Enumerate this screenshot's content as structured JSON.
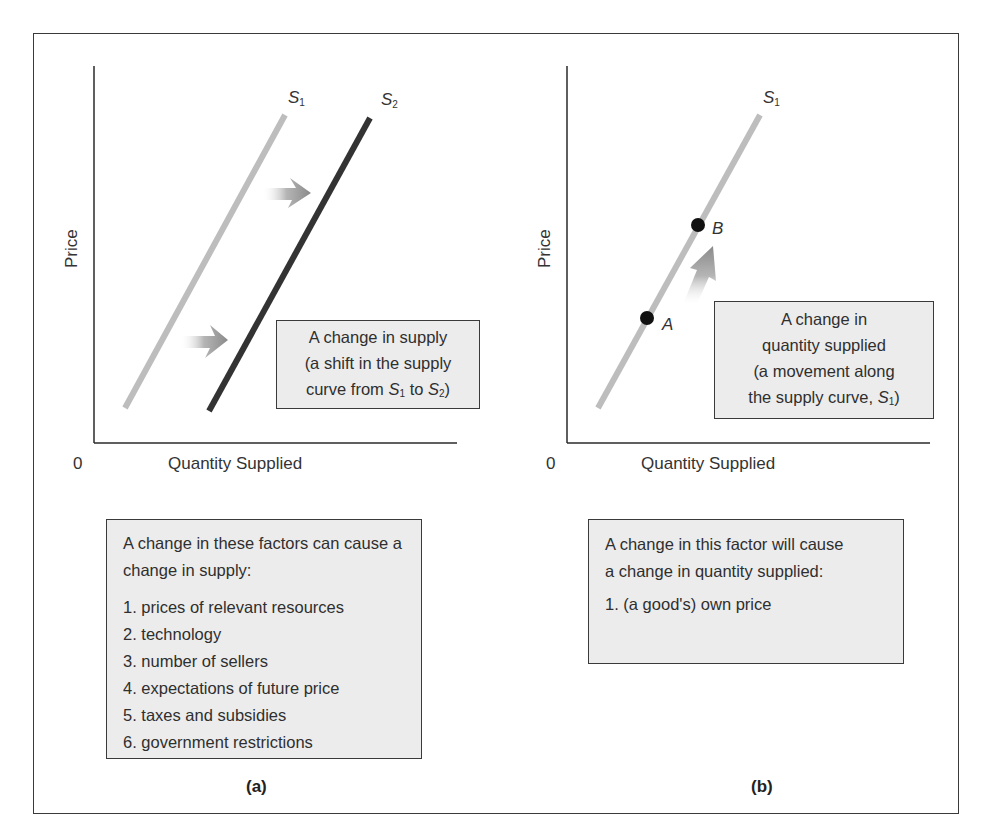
{
  "figure": {
    "panels": [
      {
        "tag": "(a)",
        "axes": {
          "y_label": "Price",
          "x_label": "Quantity Supplied",
          "origin": "0"
        },
        "curves": [
          {
            "name": "S",
            "subscript": "1",
            "color": "#bdbdbd"
          },
          {
            "name": "S",
            "subscript": "2",
            "color": "#333333"
          }
        ],
        "arrows": [
          {
            "direction": "right",
            "meaning": "shift-right"
          },
          {
            "direction": "right",
            "meaning": "shift-right"
          }
        ],
        "callout": {
          "line1": "A change in supply",
          "line2": "(a shift in the supply",
          "line3_prefix": "curve from ",
          "line3_s1": "S",
          "line3_s1_sub": "1",
          "line3_mid": " to ",
          "line3_s2": "S",
          "line3_s2_sub": "2",
          "line3_suffix": ")"
        },
        "factors_box": {
          "intro": "A change in these factors can cause a change in supply:",
          "items": [
            "1. prices of relevant resources",
            "2. technology",
            "3. number of sellers",
            "4. expectations of future price",
            "5. taxes and subsidies",
            "6. government restrictions"
          ]
        }
      },
      {
        "tag": "(b)",
        "axes": {
          "y_label": "Price",
          "x_label": "Quantity Supplied",
          "origin": "0"
        },
        "curves": [
          {
            "name": "S",
            "subscript": "1",
            "color": "#bdbdbd"
          }
        ],
        "points": [
          {
            "label": "A"
          },
          {
            "label": "B"
          }
        ],
        "arrows": [
          {
            "direction": "up-along-curve",
            "meaning": "movement-from-A-to-B"
          }
        ],
        "callout": {
          "line1": "A change in",
          "line2": "quantity supplied",
          "line3": "(a movement along",
          "line4_prefix": "the supply curve, ",
          "line4_s": "S",
          "line4_s_sub": "1",
          "line4_suffix": ")"
        },
        "factors_box": {
          "intro": "A change in this factor will cause a change in quantity supplied:",
          "items": [
            "1. (a good's) own price"
          ]
        }
      }
    ],
    "colors": {
      "border": "#3a3a3a",
      "box_fill": "#ececec",
      "curve_light": "#bdbdbd",
      "curve_dark": "#333333",
      "arrow": "#9a9a9a"
    }
  }
}
